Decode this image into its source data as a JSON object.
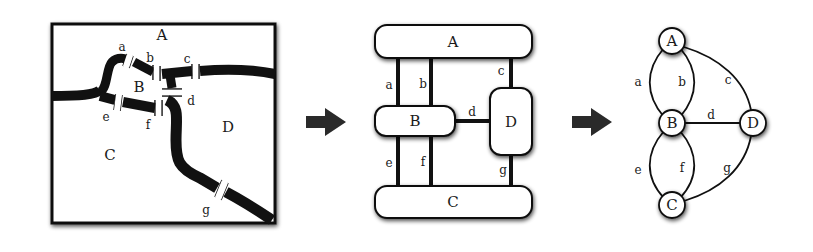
{
  "panels": {
    "map": {
      "regions": [
        {
          "id": "A",
          "label": "A",
          "x": 162,
          "y": 40
        },
        {
          "id": "B",
          "label": "B",
          "x": 139,
          "y": 92
        },
        {
          "id": "C",
          "label": "C",
          "x": 110,
          "y": 160
        },
        {
          "id": "D",
          "label": "D",
          "x": 228,
          "y": 132
        }
      ],
      "bridges": [
        {
          "id": "a",
          "label": "a",
          "x": 123,
          "y": 51
        },
        {
          "id": "b",
          "label": "b",
          "x": 150,
          "y": 62
        },
        {
          "id": "c",
          "label": "c",
          "x": 187,
          "y": 63
        },
        {
          "id": "d",
          "label": "d",
          "x": 191,
          "y": 104
        },
        {
          "id": "e",
          "label": "e",
          "x": 106,
          "y": 120
        },
        {
          "id": "f",
          "label": "f",
          "x": 148,
          "y": 128
        },
        {
          "id": "g",
          "label": "g",
          "x": 206,
          "y": 214
        }
      ]
    },
    "schematic": {
      "nodes": [
        {
          "id": "A",
          "label": "A"
        },
        {
          "id": "B",
          "label": "B"
        },
        {
          "id": "C",
          "label": "C"
        },
        {
          "id": "D",
          "label": "D"
        }
      ],
      "edges": [
        {
          "id": "a",
          "label": "a"
        },
        {
          "id": "b",
          "label": "b"
        },
        {
          "id": "c",
          "label": "c"
        },
        {
          "id": "d",
          "label": "d"
        },
        {
          "id": "e",
          "label": "e"
        },
        {
          "id": "f",
          "label": "f"
        },
        {
          "id": "g",
          "label": "g"
        }
      ]
    },
    "graph": {
      "nodes": [
        {
          "id": "A",
          "label": "A"
        },
        {
          "id": "B",
          "label": "B"
        },
        {
          "id": "C",
          "label": "C"
        },
        {
          "id": "D",
          "label": "D"
        }
      ],
      "edges": [
        {
          "id": "a",
          "label": "a",
          "from": "A",
          "to": "B"
        },
        {
          "id": "b",
          "label": "b",
          "from": "A",
          "to": "B"
        },
        {
          "id": "c",
          "label": "c",
          "from": "A",
          "to": "D"
        },
        {
          "id": "d",
          "label": "d",
          "from": "B",
          "to": "D"
        },
        {
          "id": "e",
          "label": "e",
          "from": "B",
          "to": "C"
        },
        {
          "id": "f",
          "label": "f",
          "from": "B",
          "to": "C"
        },
        {
          "id": "g",
          "label": "g",
          "from": "C",
          "to": "D"
        }
      ]
    }
  },
  "arrows": [
    {
      "id": "arrow-1",
      "icon": "right-arrow-icon"
    },
    {
      "id": "arrow-2",
      "icon": "right-arrow-icon"
    }
  ],
  "colors": {
    "ink": "#111111",
    "background": "#ffffff",
    "arrow": "#2a2a2a"
  }
}
